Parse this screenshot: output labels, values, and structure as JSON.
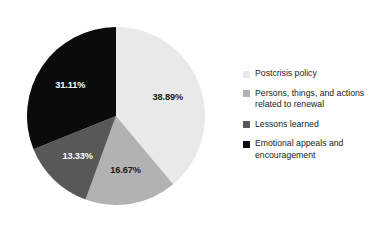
{
  "chart_data": {
    "type": "pie",
    "title": "",
    "xlabel": "",
    "ylabel": "",
    "categories": [
      "Postcrisis policy",
      "Persons, things, and actions related to renewal",
      "Lessons learned",
      "Emotional appeals and encouragement"
    ],
    "values": [
      38.89,
      16.67,
      13.33,
      31.11
    ],
    "value_labels": [
      "38.89%",
      "16.67%",
      "13.33%",
      "31.11%"
    ],
    "colors": [
      "#e9e9e9",
      "#b2b2b2",
      "#585858",
      "#0b0b0b"
    ],
    "label_colors": [
      "#1b1b1b",
      "#1b1b1b",
      "#ffffff",
      "#ffffff"
    ],
    "start_angle": 0,
    "direction": "clockwise",
    "grid": false,
    "legend_position": "right",
    "units": "percent"
  },
  "legend": {
    "entries": [
      {
        "label": "Postcrisis policy",
        "color": "#e9e9e9"
      },
      {
        "label": "Persons, things, and actions\nrelated to renewal",
        "color": "#b2b2b2"
      },
      {
        "label": "Lessons learned",
        "color": "#585858"
      },
      {
        "label": "Emotional appeals and\nencouragement",
        "color": "#0b0b0b"
      }
    ]
  },
  "pie_geometry": {
    "cx": 116,
    "cy": 116,
    "r": 89,
    "label_radius_ratio": 0.62
  }
}
